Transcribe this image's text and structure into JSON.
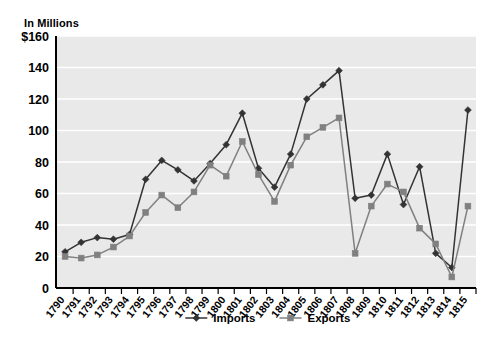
{
  "labels": {
    "units": "In Millions",
    "y_axis_prefix": "$"
  },
  "legend": {
    "position": "bottom-center",
    "entries": [
      {
        "name": "Imports",
        "color": "#333333",
        "marker": "diamond"
      },
      {
        "name": "Exports",
        "color": "#808080",
        "marker": "square"
      }
    ]
  },
  "style": {
    "plot_background": "#e9e9e9",
    "gridline_color": "#ffffff",
    "axis_color": "#000000",
    "imports_color": "#333333",
    "exports_color": "#808080"
  },
  "chart_data": {
    "type": "line",
    "title": "",
    "subtitle": "",
    "xlabel": "",
    "ylabel": "In Millions",
    "ylim": [
      0,
      160
    ],
    "ytick_step": 20,
    "ytick_labels": [
      "0",
      "20",
      "40",
      "60",
      "80",
      "100",
      "120",
      "140",
      "$160"
    ],
    "grid": true,
    "x": [
      "1790",
      "1791",
      "1792",
      "1793",
      "1794",
      "1795",
      "1796",
      "1797",
      "1798",
      "1799",
      "1800",
      "1801",
      "1802",
      "1803",
      "1804",
      "1805",
      "1806",
      "1807",
      "1808",
      "1809",
      "1810",
      "1811",
      "1812",
      "1813",
      "1814",
      "1815"
    ],
    "series": [
      {
        "name": "Imports",
        "color": "#333333",
        "values": [
          23,
          29,
          32,
          31,
          34,
          69,
          81,
          75,
          68,
          79,
          91,
          111,
          76,
          64,
          85,
          120,
          129,
          138,
          57,
          59,
          85,
          53,
          77,
          22,
          13,
          113
        ]
      },
      {
        "name": "Exports",
        "color": "#808080",
        "values": [
          20,
          19,
          21,
          26,
          33,
          48,
          59,
          51,
          61,
          78,
          71,
          93,
          72,
          55,
          78,
          96,
          102,
          108,
          22,
          52,
          66,
          61,
          38,
          28,
          7,
          52
        ]
      }
    ],
    "annotations": []
  }
}
